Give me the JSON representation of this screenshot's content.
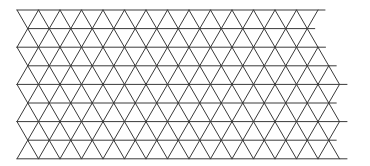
{
  "diagram": {
    "type": "triangular-grid",
    "stroke_color": "#3a3a3a",
    "background": "#ffffff",
    "side": 21.5,
    "row_height": 18.6,
    "top_y": 10,
    "rows": [
      {
        "top_left": 17,
        "top_right": 325,
        "bottom_left": 27.75,
        "bottom_right": 314.75
      },
      {
        "top_left": 27.75,
        "top_right": 314.75,
        "bottom_left": 17,
        "bottom_right": 325.5
      },
      {
        "top_left": 17,
        "top_right": 325.5,
        "bottom_left": 27.75,
        "bottom_right": 336.25
      },
      {
        "top_left": 27.75,
        "top_right": 336.25,
        "bottom_left": 17,
        "bottom_right": 347
      },
      {
        "top_left": 17,
        "top_right": 347,
        "bottom_left": 27.75,
        "bottom_right": 336.25
      },
      {
        "top_left": 27.75,
        "top_right": 336.25,
        "bottom_left": 17,
        "bottom_right": 347
      },
      {
        "top_left": 17,
        "top_right": 347,
        "bottom_left": 27.75,
        "bottom_right": 336.25
      },
      {
        "top_left": 27.75,
        "top_right": 336.25,
        "bottom_left": 17,
        "bottom_right": 347
      }
    ]
  }
}
